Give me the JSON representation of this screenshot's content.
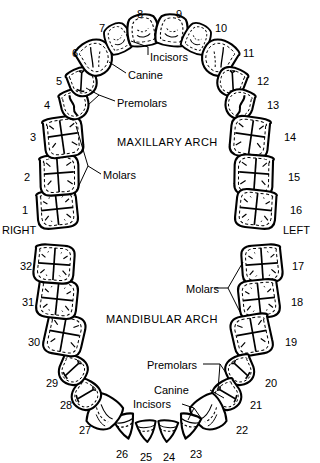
{
  "figure": {
    "type": "anatomical-diagram",
    "background_color": "#ffffff",
    "line_color": "#000000",
    "arches": [
      {
        "key": "maxillary",
        "label": "MAXILLARY ARCH"
      },
      {
        "key": "mandibular",
        "label": "MANDIBULAR ARCH"
      }
    ],
    "sides": [
      {
        "key": "right",
        "label": "RIGHT"
      },
      {
        "key": "left",
        "label": "LEFT"
      }
    ],
    "part_labels": [
      {
        "key": "max-incisors",
        "label": "Incisors"
      },
      {
        "key": "max-canine",
        "label": "Canine"
      },
      {
        "key": "max-premolars",
        "label": "Premolars"
      },
      {
        "key": "max-molars",
        "label": "Molars"
      },
      {
        "key": "man-molars",
        "label": "Molars"
      },
      {
        "key": "man-premolars",
        "label": "Premolars"
      },
      {
        "key": "man-canine",
        "label": "Canine"
      },
      {
        "key": "man-incisors",
        "label": "Incisors"
      }
    ],
    "teeth": [
      {
        "n": "1",
        "arch": "maxillary",
        "side": "right",
        "type": "molar",
        "cx": 57,
        "cy": 209,
        "nx": 22,
        "ny": 205
      },
      {
        "n": "2",
        "arch": "maxillary",
        "side": "right",
        "type": "molar",
        "cx": 59,
        "cy": 175,
        "nx": 24,
        "ny": 172
      },
      {
        "n": "3",
        "arch": "maxillary",
        "side": "right",
        "type": "molar",
        "cx": 63,
        "cy": 137,
        "nx": 30,
        "ny": 132
      },
      {
        "n": "4",
        "arch": "maxillary",
        "side": "right",
        "type": "premolar",
        "cx": 74,
        "cy": 105,
        "nx": 44,
        "ny": 100
      },
      {
        "n": "5",
        "arch": "maxillary",
        "side": "right",
        "type": "premolar",
        "cx": 82,
        "cy": 83,
        "nx": 56,
        "ny": 76
      },
      {
        "n": "6",
        "arch": "maxillary",
        "side": "right",
        "type": "canine",
        "cx": 95,
        "cy": 58,
        "nx": 72,
        "ny": 48
      },
      {
        "n": "7",
        "arch": "maxillary",
        "side": "right",
        "type": "incisor",
        "cx": 117,
        "cy": 38,
        "nx": 99,
        "ny": 23
      },
      {
        "n": "8",
        "arch": "maxillary",
        "side": "right",
        "type": "incisor",
        "cx": 142,
        "cy": 29,
        "nx": 137,
        "ny": 9
      },
      {
        "n": "9",
        "arch": "maxillary",
        "side": "left",
        "type": "incisor",
        "cx": 171,
        "cy": 29,
        "nx": 176,
        "ny": 9
      },
      {
        "n": "10",
        "arch": "maxillary",
        "side": "left",
        "type": "incisor",
        "cx": 197,
        "cy": 38,
        "nx": 215,
        "ny": 23
      },
      {
        "n": "11",
        "arch": "maxillary",
        "side": "left",
        "type": "canine",
        "cx": 218,
        "cy": 58,
        "nx": 243,
        "ny": 48
      },
      {
        "n": "12",
        "arch": "maxillary",
        "side": "left",
        "type": "premolar",
        "cx": 231,
        "cy": 83,
        "nx": 257,
        "ny": 76
      },
      {
        "n": "13",
        "arch": "maxillary",
        "side": "left",
        "type": "premolar",
        "cx": 240,
        "cy": 105,
        "nx": 267,
        "ny": 100
      },
      {
        "n": "14",
        "arch": "maxillary",
        "side": "left",
        "type": "molar",
        "cx": 250,
        "cy": 137,
        "nx": 284,
        "ny": 132
      },
      {
        "n": "15",
        "arch": "maxillary",
        "side": "left",
        "type": "molar",
        "cx": 254,
        "cy": 175,
        "nx": 288,
        "ny": 172
      },
      {
        "n": "16",
        "arch": "maxillary",
        "side": "left",
        "type": "molar",
        "cx": 256,
        "cy": 209,
        "nx": 290,
        "ny": 205
      },
      {
        "n": "17",
        "arch": "mandibular",
        "side": "left",
        "type": "molar",
        "cx": 262,
        "cy": 264,
        "nx": 292,
        "ny": 261
      },
      {
        "n": "18",
        "arch": "mandibular",
        "side": "left",
        "type": "molar",
        "cx": 260,
        "cy": 299,
        "nx": 291,
        "ny": 297
      },
      {
        "n": "19",
        "arch": "mandibular",
        "side": "left",
        "type": "molar",
        "cx": 253,
        "cy": 335,
        "nx": 285,
        "ny": 337
      },
      {
        "n": "20",
        "arch": "mandibular",
        "side": "left",
        "type": "premolar",
        "cx": 240,
        "cy": 371,
        "nx": 265,
        "ny": 378
      },
      {
        "n": "21",
        "arch": "mandibular",
        "side": "left",
        "type": "premolar",
        "cx": 228,
        "cy": 396,
        "nx": 250,
        "ny": 400
      },
      {
        "n": "22",
        "arch": "mandibular",
        "side": "left",
        "type": "canine",
        "cx": 211,
        "cy": 415,
        "nx": 236,
        "ny": 425
      },
      {
        "n": "23",
        "arch": "mandibular",
        "side": "left",
        "type": "incisor",
        "cx": 186,
        "cy": 432,
        "nx": 190,
        "ny": 449
      },
      {
        "n": "24",
        "arch": "mandibular",
        "side": "left",
        "type": "incisor",
        "cx": 166,
        "cy": 436,
        "nx": 163,
        "ny": 452
      },
      {
        "n": "25",
        "arch": "mandibular",
        "side": "right",
        "type": "incisor",
        "cx": 146,
        "cy": 436,
        "nx": 140,
        "ny": 452
      },
      {
        "n": "26",
        "arch": "mandibular",
        "side": "right",
        "type": "incisor",
        "cx": 126,
        "cy": 432,
        "nx": 116,
        "ny": 449
      },
      {
        "n": "27",
        "arch": "mandibular",
        "side": "right",
        "type": "canine",
        "cx": 101,
        "cy": 415,
        "nx": 79,
        "ny": 425
      },
      {
        "n": "28",
        "arch": "mandibular",
        "side": "right",
        "type": "premolar",
        "cx": 85,
        "cy": 396,
        "nx": 60,
        "ny": 400
      },
      {
        "n": "29",
        "arch": "mandibular",
        "side": "right",
        "type": "premolar",
        "cx": 73,
        "cy": 371,
        "nx": 46,
        "ny": 378
      },
      {
        "n": "30",
        "arch": "mandibular",
        "side": "right",
        "type": "molar",
        "cx": 63,
        "cy": 335,
        "nx": 28,
        "ny": 337
      },
      {
        "n": "31",
        "arch": "mandibular",
        "side": "right",
        "type": "molar",
        "cx": 56,
        "cy": 299,
        "nx": 22,
        "ny": 297
      },
      {
        "n": "32",
        "arch": "mandibular",
        "side": "right",
        "type": "molar",
        "cx": 54,
        "cy": 264,
        "nx": 20,
        "ny": 261
      }
    ],
    "text_positions": {
      "maxillary_arch": {
        "x": 117,
        "y": 143
      },
      "mandibular_arch": {
        "x": 106,
        "y": 320
      },
      "right": {
        "x": 2,
        "y": 230
      },
      "left": {
        "x": 285,
        "y": 230
      },
      "max_incisors": {
        "x": 145,
        "y": 58
      },
      "max_canine": {
        "x": 128,
        "y": 76
      },
      "max_premolars": {
        "x": 117,
        "y": 104
      },
      "max_molars": {
        "x": 103,
        "y": 176
      },
      "man_molars": {
        "x": 188,
        "y": 291
      },
      "man_premolars": {
        "x": 148,
        "y": 366
      },
      "man_canine": {
        "x": 152,
        "y": 392
      },
      "man_incisors": {
        "x": 134,
        "y": 404
      }
    }
  }
}
